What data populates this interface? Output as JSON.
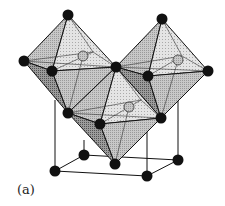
{
  "figure": {
    "panel_label": "(a)",
    "colors": {
      "atom": "#111111",
      "center_atom": "#9a9a9a",
      "face_light": "#d9d9d9",
      "face_mid": "#b8b8b8",
      "face_dark": "#8d8d8d",
      "edge": "#111111"
    },
    "octahedra": [
      {
        "name": "left",
        "top": [
          68,
          15
        ],
        "left": [
          24,
          61
        ],
        "front": [
          52,
          71
        ],
        "right": [
          116,
          67
        ],
        "back": [
          93,
          52
        ],
        "bottom": [
          68,
          113
        ],
        "center": [
          83,
          56
        ]
      },
      {
        "name": "right",
        "top": [
          162,
          19
        ],
        "left": [
          116,
          67
        ],
        "front": [
          148,
          76
        ],
        "right": [
          208,
          71
        ],
        "back": [
          182,
          56
        ],
        "bottom": [
          161,
          118
        ],
        "center": [
          178,
          60
        ]
      },
      {
        "name": "middle",
        "top": [
          116,
          67
        ],
        "left": [
          68,
          113
        ],
        "front": [
          100,
          124
        ],
        "right": [
          161,
          118
        ],
        "back": [
          141,
          100
        ],
        "bottom": [
          115,
          164
        ],
        "center": [
          129,
          107
        ]
      }
    ],
    "cube_nodes": [
      [
        55,
        171
      ],
      [
        84,
        155
      ],
      [
        147,
        176
      ],
      [
        178,
        160
      ]
    ]
  }
}
